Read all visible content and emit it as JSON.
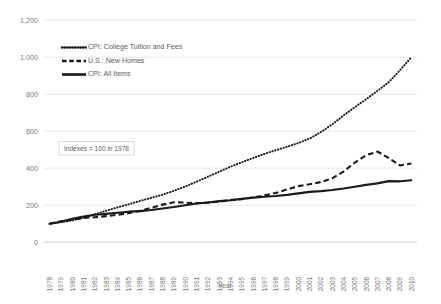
{
  "chart_data": {
    "type": "line",
    "title": "",
    "xlabel": "Year",
    "ylabel": "",
    "annotation": "Indexes = 100 in 1978",
    "grid": true,
    "legend_position": "upper-left",
    "ylim": [
      0,
      1200
    ],
    "yticks": [
      "0",
      "200",
      "400",
      "600",
      "800",
      "1,000",
      "1,200"
    ],
    "ytick_values": [
      0,
      200,
      400,
      600,
      800,
      1000,
      1200
    ],
    "categories": [
      "1978",
      "1979",
      "1980",
      "1981",
      "1982",
      "1983",
      "1984",
      "1985",
      "1986",
      "1987",
      "1988",
      "1989",
      "1990",
      "1991",
      "1992",
      "1993",
      "1994",
      "1995",
      "1996",
      "1997",
      "1998",
      "1999",
      "2000",
      "2001",
      "2002",
      "2003",
      "2004",
      "2005",
      "2006",
      "2007",
      "2008",
      "2009",
      "2010"
    ],
    "series": [
      {
        "name": "CPI: College Tuition and Fees",
        "style": "dotted",
        "color": "#1a1a1a",
        "values": [
          100,
          108,
          118,
          132,
          151,
          170,
          188,
          205,
          223,
          240,
          257,
          278,
          301,
          327,
          354,
          381,
          408,
          432,
          455,
          477,
          497,
          516,
          536,
          560,
          595,
          637,
          685,
          730,
          773,
          818,
          865,
          930,
          1000
        ]
      },
      {
        "name": "U.S.: New Homes",
        "style": "dashed",
        "color": "#1a1a1a",
        "values": [
          100,
          113,
          122,
          131,
          135,
          141,
          148,
          157,
          170,
          186,
          203,
          216,
          214,
          211,
          213,
          219,
          228,
          233,
          242,
          253,
          266,
          285,
          303,
          313,
          325,
          345,
          382,
          430,
          470,
          490,
          455,
          415,
          425
        ]
      },
      {
        "name": "CPI: All Items",
        "style": "solid",
        "color": "#1a1a1a",
        "values": [
          100,
          111,
          126,
          139,
          148,
          153,
          159,
          165,
          168,
          174,
          182,
          190,
          200,
          209,
          215,
          222,
          227,
          234,
          241,
          246,
          250,
          256,
          264,
          272,
          276,
          282,
          290,
          300,
          310,
          318,
          330,
          329,
          335
        ]
      }
    ]
  },
  "legend": {
    "items": [
      {
        "label": "CPI: College Tuition and Fees"
      },
      {
        "label": "U.S.: New Homes"
      },
      {
        "label": "CPI: All Items"
      }
    ]
  }
}
